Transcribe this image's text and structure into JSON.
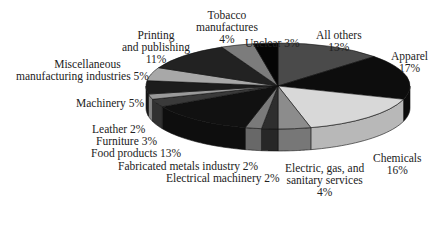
{
  "chart_data": {
    "type": "pie",
    "style": "3d",
    "title": "",
    "unit": "%",
    "slices": [
      {
        "label": "All others",
        "value": 13,
        "color": "#4a4a4a"
      },
      {
        "label": "Apparel",
        "value": 17,
        "color": "#0d0d0d"
      },
      {
        "label": "Chemicals",
        "value": 16,
        "color": "#d8d8d8"
      },
      {
        "label": "Electric, gas, and sanitary services",
        "value": 4,
        "color": "#8c8c8c"
      },
      {
        "label": "Electrical machinery",
        "value": 2,
        "color": "#2e2e2e"
      },
      {
        "label": "Fabricated metals industry",
        "value": 2,
        "color": "#7a7a7a"
      },
      {
        "label": "Food products",
        "value": 13,
        "color": "#111111"
      },
      {
        "label": "Furniture",
        "value": 3,
        "color": "#3a3a3a"
      },
      {
        "label": "Leather",
        "value": 2,
        "color": "#9a9a9a"
      },
      {
        "label": "Machinery",
        "value": 5,
        "color": "#1c1c1c"
      },
      {
        "label": "Miscellaneous manufacturing industries",
        "value": 5,
        "color": "#a8a8a8"
      },
      {
        "label": "Printing and publishing",
        "value": 11,
        "color": "#222222"
      },
      {
        "label": "Tobacco manufactures",
        "value": 4,
        "color": "#7c7c7c"
      },
      {
        "label": "Unclear",
        "value": 3,
        "color": "#050505"
      }
    ]
  },
  "labels": {
    "all_others": [
      "All others",
      "13%"
    ],
    "apparel": [
      "Apparel",
      "17%"
    ],
    "chemicals": [
      "Chemicals",
      "16%"
    ],
    "electric": [
      "Electric, gas, and",
      "sanitary services",
      "4%"
    ],
    "electrical_machinery": "Electrical machinery 2%",
    "fabricated": "Fabricated metals industry 2%",
    "food": "Food products 13%",
    "furniture": "Furniture 3%",
    "leather": "Leather 2%",
    "machinery": "Machinery 5%",
    "misc": [
      "Miscellaneous",
      "manufacturing industries 5%"
    ],
    "printing": [
      "Printing",
      "and publishing",
      "11%"
    ],
    "tobacco": [
      "Tobacco",
      "manufactures",
      "4%"
    ],
    "unclear": "Unclear 3%"
  }
}
